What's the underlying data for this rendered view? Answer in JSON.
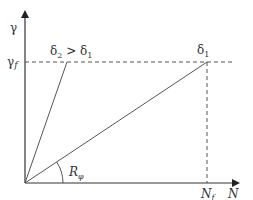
{
  "diagram": {
    "axes": {
      "y_label": "γ",
      "x_label": "N"
    },
    "levels": {
      "gamma_f": {
        "symbol": "γ",
        "subscript": "f"
      },
      "N_f": {
        "symbol": "N",
        "subscript": "f"
      }
    },
    "points": {
      "delta1": {
        "symbol": "δ",
        "subscript": "1"
      },
      "delta2_relation": {
        "left_symbol": "δ",
        "left_sub": "2",
        "op": " > ",
        "right_symbol": "δ",
        "right_sub": "1"
      }
    },
    "angle": {
      "symbol": "R",
      "subscript": "φ"
    },
    "colors": {
      "axis": "#333333",
      "line": "#555555",
      "dashed": "#555555"
    }
  }
}
